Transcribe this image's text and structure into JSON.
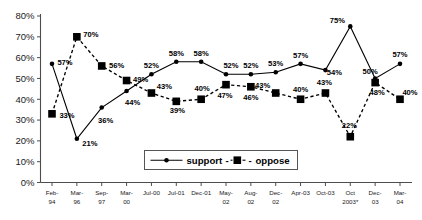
{
  "chart_data": {
    "type": "line",
    "title": "",
    "xlabel": "",
    "ylabel": "",
    "ylim": [
      0,
      80
    ],
    "ytick_step": 10,
    "grid": false,
    "legend_position": "inside-bottom-center",
    "categories": [
      "Feb-94",
      "Mar-96",
      "Sep-97",
      "Mar-00",
      "Jul-00",
      "Jul-01",
      "Dec-01",
      "May-02",
      "Aug-02",
      "Dec-02",
      "Apr-03",
      "Oct-03",
      "Oct 2003*",
      "Dec-03",
      "Mar-04"
    ],
    "ytick_labels": [
      "80%",
      "70%",
      "60%",
      "50%",
      "40%",
      "30%",
      "20%",
      "10%",
      "0%"
    ],
    "ytick_values": [
      80,
      70,
      60,
      50,
      40,
      30,
      20,
      10,
      0
    ],
    "series": [
      {
        "name": "support",
        "marker": "circle",
        "line": "solid",
        "color": "#000000",
        "values": [
          57,
          21,
          36,
          44,
          52,
          58,
          58,
          52,
          52,
          53,
          57,
          54,
          75,
          50,
          57
        ],
        "labels": [
          "57%",
          "21%",
          "36%",
          "44%",
          "52%",
          "58%",
          "58%",
          "52%",
          "52%",
          "53%",
          "57%",
          "54%",
          "75%",
          "50%",
          "57%"
        ]
      },
      {
        "name": "oppose",
        "marker": "square",
        "line": "dashed",
        "color": "#000000",
        "values": [
          33,
          70,
          56,
          49,
          43,
          39,
          40,
          47,
          46,
          43,
          40,
          43,
          22,
          48,
          40
        ],
        "labels": [
          "33%",
          "70%",
          "56%",
          "49%",
          "43%",
          "39%",
          "40%",
          "47%",
          "46%",
          "43%",
          "40%",
          "43%",
          "22%",
          "48%",
          "40%"
        ]
      }
    ]
  },
  "legend": {
    "support_label": "support",
    "separator_left": "-",
    "separator_right": "-",
    "oppose_label": "oppose"
  }
}
